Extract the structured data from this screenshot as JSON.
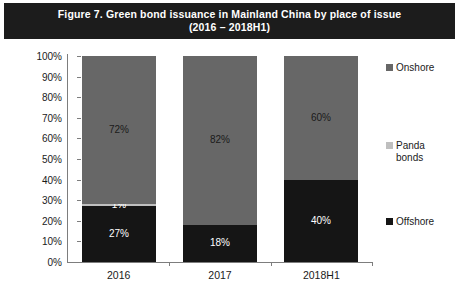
{
  "figure": {
    "title_line1": "Figure 7.  Green bond issuance in Mainland China by place of issue",
    "title_line2": "(2016 – 2018H1)",
    "title_band_color": "#1c1c1c",
    "background_color": "#ffffff"
  },
  "chart_data": {
    "type": "bar",
    "title": "Figure 7.  Green bond issuance in Mainland China by place of issue (2016 – 2018H1)",
    "subtitle": "(2016 – 2018H1)",
    "stacked": true,
    "stacked_mode": "percent",
    "xlabel": "",
    "ylabel": "",
    "ylim": [
      0,
      100
    ],
    "ytick_labels": [
      "0%",
      "10%",
      "20%",
      "30%",
      "40%",
      "50%",
      "60%",
      "70%",
      "80%",
      "90%",
      "100%"
    ],
    "ytick_values": [
      0,
      10,
      20,
      30,
      40,
      50,
      60,
      70,
      80,
      90,
      100
    ],
    "grid": false,
    "legend_position": "right",
    "categories": [
      "2016",
      "2017",
      "2018H1"
    ],
    "series": [
      {
        "name": "Offshore",
        "color": "#151515",
        "values": [
          27,
          18,
          40
        ],
        "labels": [
          "27%",
          "18%",
          "40%"
        ]
      },
      {
        "name": "Panda bonds",
        "color": "#bfbfbf",
        "values": [
          1,
          0,
          0
        ],
        "labels": [
          "1%",
          "0%",
          "0%"
        ]
      },
      {
        "name": "Onshore",
        "color": "#676767",
        "values": [
          72,
          82,
          60
        ],
        "labels": [
          "72%",
          "82%",
          "60%"
        ]
      }
    ]
  },
  "legend": {
    "items": [
      {
        "label": "Onshore",
        "color": "#676767"
      },
      {
        "label": "Panda\nbonds",
        "color": "#bfbfbf"
      },
      {
        "label": "Offshore",
        "color": "#151515"
      }
    ]
  }
}
